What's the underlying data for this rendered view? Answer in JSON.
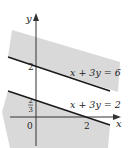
{
  "diagram": {
    "type": "linear-inequality-region",
    "axes": {
      "x_label": "x",
      "y_label": "y",
      "origin_label": "0"
    },
    "ticks": {
      "x": [
        {
          "value": 2,
          "label": "2"
        }
      ],
      "y": [
        {
          "value": 2,
          "label": "2"
        },
        {
          "value": 0.6667,
          "label_num": "2",
          "label_den": "3"
        }
      ]
    },
    "lines": [
      {
        "equation": "x + 3y = 6",
        "label": "x + 3y = 6"
      },
      {
        "equation": "x + 3y = 2",
        "label": "x + 3y = 2"
      }
    ],
    "shaded_regions": [
      {
        "description": "region above line x + 3y = 6",
        "color": "#d9d9d9"
      },
      {
        "description": "region below line x + 3y = 2",
        "color": "#d9d9d9"
      }
    ],
    "colors": {
      "shade": "#d9d9d9",
      "line": "#1a1a1a",
      "axis": "#333333"
    }
  }
}
